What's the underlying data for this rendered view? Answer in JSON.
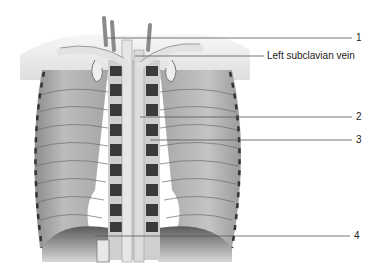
{
  "figure": {
    "labels": [
      {
        "id": "1",
        "text": "1",
        "x": 356,
        "y": 33,
        "line_from": 107,
        "line_y": 38
      },
      {
        "id": "left-subclavian",
        "text": "Left subclavian vein",
        "x": 266,
        "y": 51,
        "line_from": 135,
        "line_y": 56
      },
      {
        "id": "2",
        "text": "2",
        "x": 356,
        "y": 111,
        "line_from": 140,
        "line_y": 117
      },
      {
        "id": "3",
        "text": "3",
        "x": 356,
        "y": 134,
        "line_from": 150,
        "line_y": 140
      },
      {
        "id": "4",
        "text": "4",
        "x": 354,
        "y": 230,
        "line_from": 95,
        "line_y": 236
      }
    ]
  },
  "colors": {
    "background": "#ffffff",
    "wall": "#b8b8b8",
    "wall_dark": "#7a7a7a",
    "vessel": "#e4e4e4",
    "vertebra": "#3a3a3a",
    "leader": "#555555"
  }
}
